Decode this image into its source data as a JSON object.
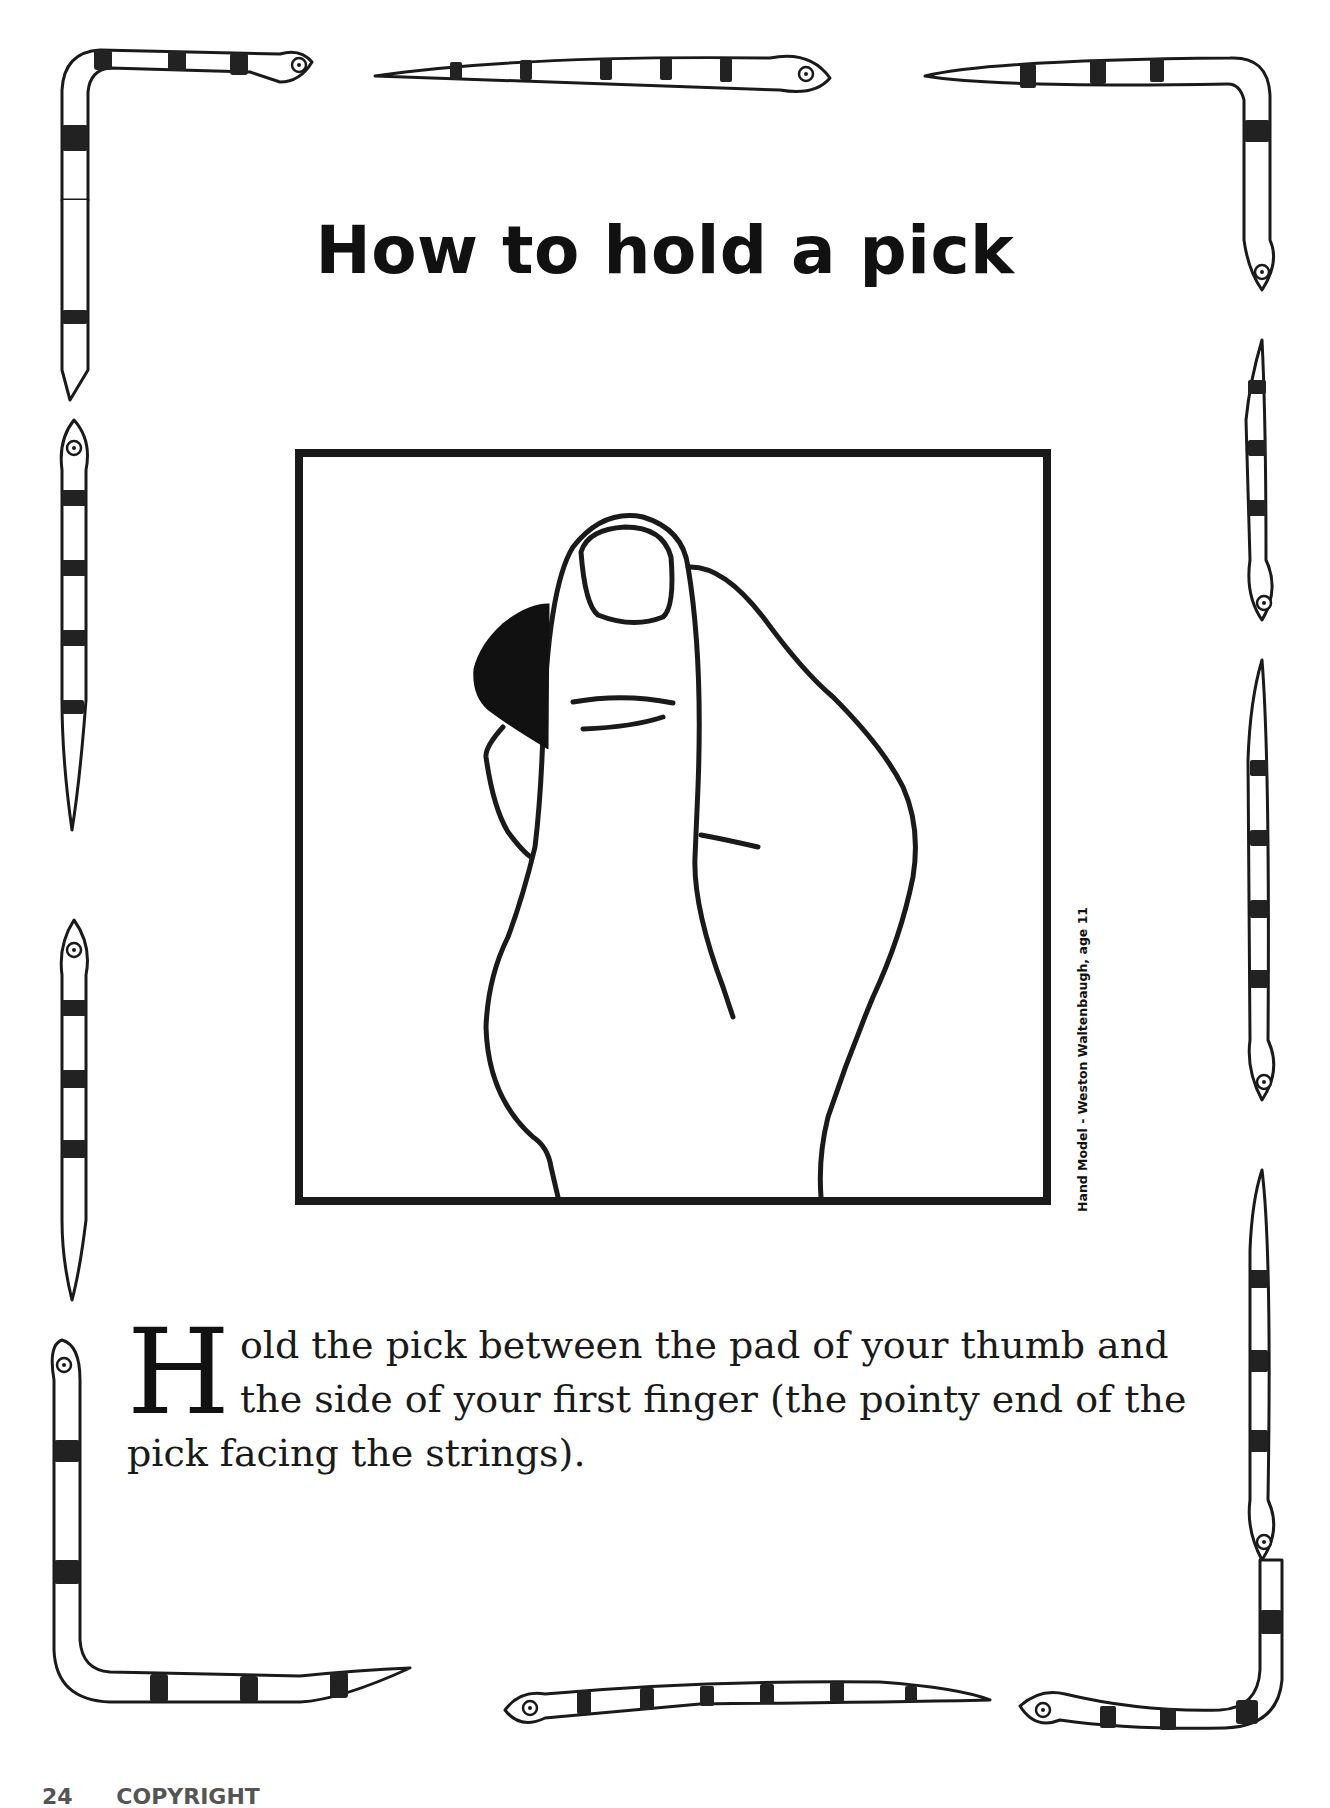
{
  "page": {
    "title": "How to hold a pick",
    "figure": {
      "description": "Line drawing of a hand holding a guitar pick between thumb and first finger",
      "credit": "Hand Model - Weston Waltenbaugh, age 11"
    },
    "body": {
      "dropcap": "H",
      "text": "old the pick between the pad of your thumb and the side of your first finger (the pointy end of the pick facing the strings)."
    },
    "footer": {
      "page_number": "24",
      "running_text": "COPYRIGHT"
    },
    "border": {
      "motif": "striped-snakes",
      "colors": {
        "outline": "#1a1a1a",
        "band": "#222222",
        "fill": "#ffffff"
      }
    }
  }
}
